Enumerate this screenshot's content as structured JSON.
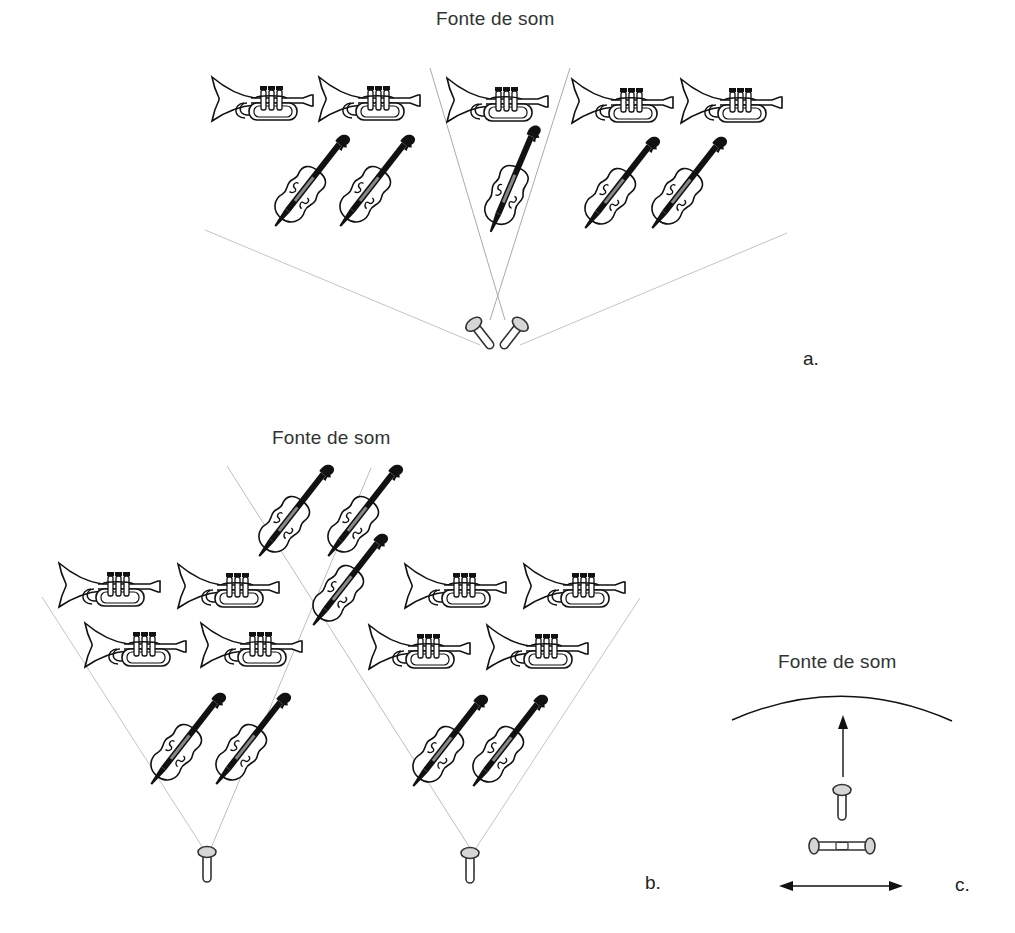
{
  "figure": {
    "panels": [
      {
        "id": "a",
        "letter": "a.",
        "title": "Fonte de som",
        "description": "Coincident (XY) crossed microphone pair capturing a full ensemble of trumpets and violins",
        "microphones": [
          {
            "type": "crossed-pair",
            "x": 497,
            "y": 330
          }
        ],
        "instruments": {
          "trumpets": 5,
          "violins": 5
        }
      },
      {
        "id": "b",
        "letter": "b.",
        "title": "Fonte de som",
        "description": "Spaced pair of cardioid microphones with overlapping pickup angles",
        "microphones": [
          {
            "type": "cardioid",
            "x": 207,
            "y": 852
          },
          {
            "type": "cardioid",
            "x": 470,
            "y": 853
          }
        ],
        "instruments": {
          "trumpets": 8,
          "violins": 7
        }
      },
      {
        "id": "c",
        "letter": "c.",
        "title": "Fonte de som",
        "description": "Mid-side configuration: forward-facing mic with figure-of-eight mic oriented sideways",
        "microphones": [
          {
            "type": "cardioid-forward",
            "x": 842,
            "y": 790
          },
          {
            "type": "figure-eight",
            "x": 842,
            "y": 846
          }
        ]
      }
    ],
    "colors": {
      "ink": "#111111",
      "pickup_line": "#bbbbbb",
      "mic_head_fill": "#d6d6d6",
      "background": "#ffffff"
    }
  }
}
